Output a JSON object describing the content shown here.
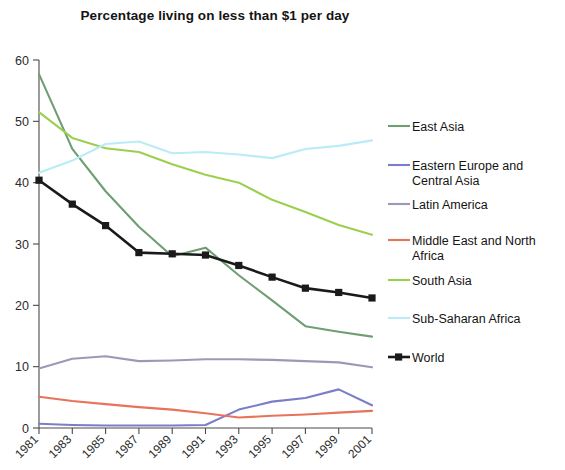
{
  "chart_title": "Percentage living on less than $1 per day",
  "axes": {
    "y_ticks": [
      "0",
      "10",
      "20",
      "30",
      "40",
      "50",
      "60"
    ],
    "x_ticks": [
      "1981",
      "1983",
      "1985",
      "1987",
      "1989",
      "1991",
      "1993",
      "1995",
      "1997",
      "1999",
      "2001"
    ],
    "ylabel": "",
    "xlabel": ""
  },
  "legend": {
    "items": [
      {
        "label": "East Asia",
        "color": "#6f9e72",
        "marker": "none"
      },
      {
        "label": "Eastern Europe and Central Asia",
        "color": "#7a7ec8",
        "marker": "none"
      },
      {
        "label": "Latin America",
        "color": "#9a9ab8",
        "marker": "none"
      },
      {
        "label": "Middle East and North Africa",
        "color": "#e8735a",
        "marker": "none"
      },
      {
        "label": "South Asia",
        "color": "#9bd04f",
        "marker": "none"
      },
      {
        "label": "Sub-Saharan Africa",
        "color": "#b9ecf7",
        "marker": "none"
      },
      {
        "label": "World",
        "color": "#1a1a1a",
        "marker": "square"
      }
    ]
  },
  "chart_data": {
    "type": "line",
    "title": "Percentage living on less than $1 per day",
    "xlabel": "",
    "ylabel": "",
    "xlim": [
      1981,
      2001
    ],
    "ylim": [
      0,
      60
    ],
    "grid": false,
    "legend_position": "right",
    "x": [
      1981,
      1983,
      1985,
      1987,
      1989,
      1991,
      1993,
      1995,
      1997,
      1999,
      2001
    ],
    "series": [
      {
        "name": "East Asia",
        "color": "#6f9e72",
        "values": [
          57.7,
          45.5,
          38.6,
          32.8,
          28.0,
          29.4,
          24.9,
          20.8,
          16.6,
          15.7,
          14.9
        ]
      },
      {
        "name": "Eastern Europe and Central Asia",
        "color": "#7a7ec8",
        "values": [
          0.7,
          0.5,
          0.4,
          0.4,
          0.4,
          0.5,
          3.0,
          4.3,
          4.9,
          6.3,
          3.7
        ]
      },
      {
        "name": "Latin America",
        "color": "#9a9ab8",
        "values": [
          9.7,
          11.3,
          11.7,
          10.9,
          11.0,
          11.2,
          11.2,
          11.1,
          10.9,
          10.7,
          9.9
        ]
      },
      {
        "name": "Middle East and North Africa",
        "color": "#e8735a",
        "values": [
          5.1,
          4.4,
          3.9,
          3.4,
          3.0,
          2.4,
          1.7,
          2.0,
          2.2,
          2.5,
          2.8
        ]
      },
      {
        "name": "South Asia",
        "color": "#9bd04f",
        "values": [
          51.5,
          47.3,
          45.6,
          45.0,
          43.0,
          41.3,
          40.0,
          37.2,
          35.2,
          33.1,
          31.5
        ]
      },
      {
        "name": "Sub-Saharan Africa",
        "color": "#b9ecf7",
        "values": [
          41.6,
          43.6,
          46.3,
          46.7,
          44.8,
          45.0,
          44.6,
          44.0,
          45.5,
          46.0,
          46.9
        ]
      },
      {
        "name": "World",
        "color": "#1a1a1a",
        "values": [
          40.4,
          36.5,
          33.0,
          28.6,
          28.4,
          28.2,
          26.5,
          24.6,
          22.8,
          22.1,
          21.2
        ]
      }
    ]
  }
}
